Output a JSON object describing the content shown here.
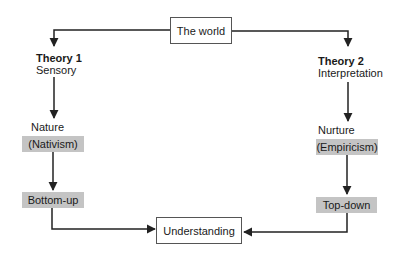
{
  "diagram": {
    "top_node": "The world",
    "bottom_node": "Understanding",
    "left_branch": {
      "title": "Theory 1",
      "subtitle": "Sensory",
      "view_label": "Nature",
      "view_term": "(Nativism)",
      "processing": "Bottom-up"
    },
    "right_branch": {
      "title": "Theory 2",
      "subtitle": "Interpretation",
      "view_label": "Nurture",
      "view_term": "(Empiricism)",
      "processing": "Top-down"
    },
    "colors": {
      "line": "#222222",
      "shaded_box": "#c4c4c4",
      "outline": "#555555"
    }
  }
}
